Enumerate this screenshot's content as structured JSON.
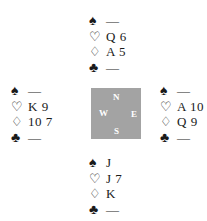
{
  "suits": {
    "spades": "♠",
    "hearts": "♡",
    "diamonds": "♢",
    "clubs": "♣"
  },
  "hands": {
    "north": {
      "spades": "—",
      "hearts": "Q 6",
      "diamonds": "A 5",
      "clubs": "—"
    },
    "west": {
      "spades": "—",
      "hearts": "K 9",
      "diamonds": "10 7",
      "clubs": "—"
    },
    "east": {
      "spades": "—",
      "hearts": "A 10",
      "diamonds": "Q 9",
      "clubs": "—"
    },
    "south": {
      "spades": "J",
      "hearts": "J 7",
      "diamonds": "K",
      "clubs": "—"
    }
  },
  "compass": {
    "n": "N",
    "e": "E",
    "s": "S",
    "w": "W",
    "color": "#a3a3a3"
  }
}
